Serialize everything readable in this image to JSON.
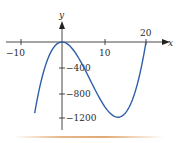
{
  "chart_data": {
    "type": "line",
    "title": "",
    "xlabel": "x",
    "ylabel": "y",
    "x_ticks": [
      -10,
      10,
      20
    ],
    "x_tick_labels": [
      "−10",
      "10",
      "20"
    ],
    "y_ticks": [
      -400,
      -800,
      -1200
    ],
    "y_tick_labels": [
      "−400",
      "−800",
      "−1200"
    ],
    "xlim": [
      -14,
      25
    ],
    "ylim": [
      -1450,
      200
    ],
    "grid": false,
    "legend": null,
    "series": [
      {
        "name": "curve",
        "color": "#2f5fa8",
        "x": [
          -6.5,
          -5,
          -4,
          -3,
          -2,
          -1,
          0,
          2,
          4,
          6,
          8,
          10,
          12,
          13.3,
          15,
          17,
          18,
          19,
          19.5,
          20
        ],
        "y": [
          -1120,
          -625,
          -384,
          -207,
          -88,
          -21,
          0,
          -72,
          -256,
          -504,
          -768,
          -1000,
          -1152,
          -1185,
          -1125,
          -867,
          -648,
          -361,
          -190,
          0
        ]
      }
    ]
  },
  "axes": {
    "x_label": "x",
    "y_label": "y",
    "x_tick_labels": [
      "−10",
      "10",
      "20"
    ],
    "y_tick_labels": [
      "−400",
      "−800",
      "−1200"
    ]
  },
  "colors": {
    "curve": "#2f5fa8",
    "axis": "#333333",
    "bottom_rule": "#e3a872"
  }
}
